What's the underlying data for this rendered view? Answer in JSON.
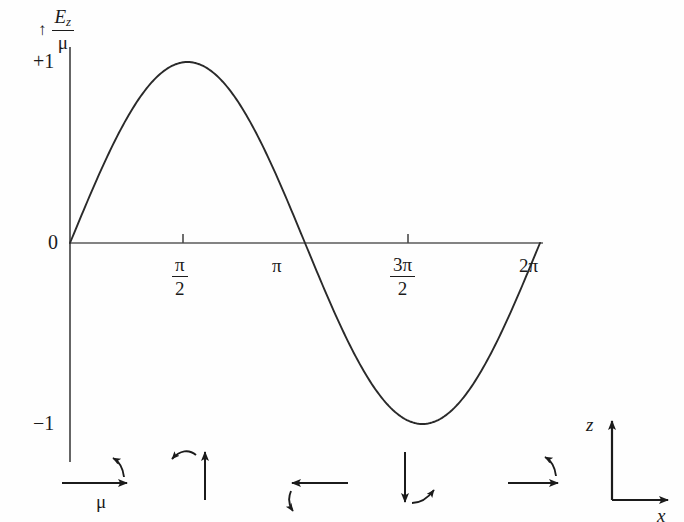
{
  "figure": {
    "background_color": "#fefefe",
    "ink_color": "#1b1b1b",
    "curve_color": "#2a2a2a"
  },
  "axes": {
    "y_axis_caption_arrow": "↑",
    "y_axis_numerator": "E",
    "y_axis_numerator_sub": "z",
    "y_axis_denominator": "μ",
    "y_tick_top": "+1",
    "y_tick_zero": "0",
    "y_tick_bottom": "−1",
    "x_ticks": [
      {
        "label_num": "π",
        "label_den": "2",
        "is_fraction": true,
        "has_tick_mark": true
      },
      {
        "label_num": "π",
        "label_den": "",
        "is_fraction": false,
        "has_tick_mark": false
      },
      {
        "label_num": "3π",
        "label_den": "2",
        "is_fraction": true,
        "has_tick_mark": true
      },
      {
        "label_num": "2π",
        "label_den": "",
        "is_fraction": false,
        "has_tick_mark": false
      }
    ]
  },
  "chart_data": {
    "type": "line",
    "title": "",
    "xlabel": "",
    "ylabel": "E_z / μ",
    "xlim": [
      0,
      6.283185307179586
    ],
    "ylim": [
      -1,
      1
    ],
    "grid": false,
    "legend": "none",
    "x_tick_values": [
      1.5707963,
      3.1415927,
      4.712389,
      6.2831853
    ],
    "x_tick_labels": [
      "π/2",
      "π",
      "3π/2",
      "2π"
    ],
    "y_tick_values": [
      1,
      0,
      -1
    ],
    "y_tick_labels": [
      "+1",
      "0",
      "−1"
    ],
    "series": [
      {
        "name": "E_z/μ = sin(x)",
        "function": "sin",
        "amplitude": 1,
        "period": 6.283185307179586,
        "phase": 0,
        "x": [
          0.0,
          0.3141593,
          0.6283185,
          0.9424778,
          1.2566371,
          1.5707963,
          1.8849556,
          2.1991149,
          2.5132741,
          2.8274334,
          3.1415927,
          3.4557519,
          3.7699112,
          4.0840704,
          4.3982297,
          4.712389,
          5.0265482,
          5.3407075,
          5.6548668,
          5.969026,
          6.2831853
        ],
        "values": [
          0.0,
          0.309,
          0.588,
          0.809,
          0.951,
          1.0,
          0.951,
          0.809,
          0.588,
          0.309,
          0.0,
          -0.309,
          -0.588,
          -0.809,
          -0.951,
          -1.0,
          -0.951,
          -0.809,
          -0.588,
          -0.309,
          0.0
        ]
      }
    ]
  },
  "dipole_row": {
    "caption_mu": "μ",
    "items": [
      {
        "name": "dipole-phase-0",
        "direction": "right",
        "rotation": "counterclockwise-up",
        "has_mu_label": true
      },
      {
        "name": "dipole-phase-quarter",
        "direction": "up",
        "rotation": "counterclockwise-left",
        "has_mu_label": false
      },
      {
        "name": "dipole-phase-half",
        "direction": "left",
        "rotation": "counterclockwise-down",
        "has_mu_label": false
      },
      {
        "name": "dipole-phase-three-quarter",
        "direction": "down",
        "rotation": "counterclockwise-right",
        "has_mu_label": false
      },
      {
        "name": "dipole-phase-full",
        "direction": "right",
        "rotation": "counterclockwise-up",
        "has_mu_label": false
      }
    ]
  },
  "coordinate_key": {
    "vertical_axis_label": "z",
    "horizontal_axis_label": "x"
  }
}
